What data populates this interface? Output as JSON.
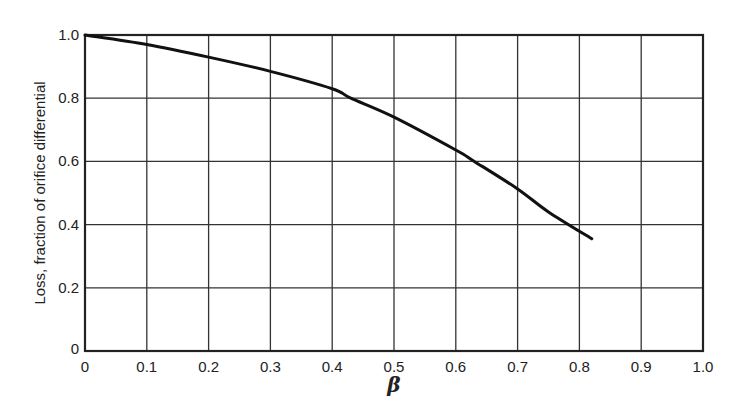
{
  "chart_data": {
    "type": "line",
    "title": "",
    "xlabel": "β",
    "ylabel": "Loss, fraction of orifice differential",
    "xlim": [
      0,
      1.0
    ],
    "ylim": [
      0,
      1.0
    ],
    "grid": true,
    "legend": null,
    "x_ticks": [
      "0",
      "0.1",
      "0.2",
      "0.3",
      "0.4",
      "0.5",
      "0.6",
      "0.7",
      "0.8",
      "0.9",
      "1.0"
    ],
    "y_ticks": [
      "0",
      "0.2",
      "0.4",
      "0.6",
      "0.8",
      "1.0"
    ],
    "series": [
      {
        "name": "Loss vs β",
        "x": [
          0,
          0.1,
          0.2,
          0.3,
          0.4,
          0.43,
          0.5,
          0.6,
          0.63,
          0.7,
          0.75,
          0.82
        ],
        "y": [
          1.0,
          0.97,
          0.93,
          0.885,
          0.83,
          0.8,
          0.74,
          0.636,
          0.6,
          0.513,
          0.44,
          0.355
        ]
      }
    ]
  },
  "colors": {
    "line": "#111111",
    "grid": "#333333",
    "background": "#ffffff"
  }
}
